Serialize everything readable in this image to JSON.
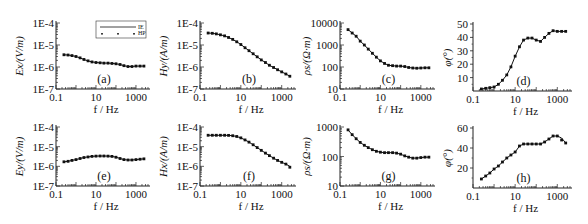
{
  "chart_data": [
    {
      "id": "a",
      "type": "line",
      "panel_label": "(a)",
      "ylabel": "Ex/(V/m)",
      "xlabel": "f / Hz",
      "yscale": "log",
      "ylim": [
        1e-07,
        0.0001
      ],
      "yticks": [
        "1E-7",
        "1E-6",
        "1E-5",
        "1E-4"
      ],
      "xscale": "log",
      "xlim": [
        0.1,
        4000
      ],
      "xticks": [
        "0.1",
        "10",
        "1000"
      ],
      "legend": {
        "position": "top-right",
        "entries": [
          "IE",
          "HP"
        ]
      },
      "x": [
        0.25,
        0.4,
        0.63,
        1,
        1.6,
        2.5,
        4,
        6.3,
        10,
        16,
        25,
        40,
        63,
        100,
        160,
        250,
        400,
        630,
        1000,
        1600,
        2500
      ],
      "series": [
        {
          "name": "IE",
          "style": "line",
          "values": [
            3.6e-06,
            3.5e-06,
            3.3e-06,
            3e-06,
            2.6e-06,
            2.2e-06,
            1.9e-06,
            1.7e-06,
            1.6e-06,
            1.55e-06,
            1.5e-06,
            1.5e-06,
            1.45e-06,
            1.4e-06,
            1.3e-06,
            1.15e-06,
            1.05e-06,
            1.05e-06,
            1.1e-06,
            1.1e-06,
            1.1e-06
          ]
        },
        {
          "name": "HP",
          "style": "points",
          "values": [
            3.6e-06,
            3.5e-06,
            3.3e-06,
            3e-06,
            2.6e-06,
            2.2e-06,
            1.9e-06,
            1.7e-06,
            1.6e-06,
            1.55e-06,
            1.5e-06,
            1.5e-06,
            1.45e-06,
            1.4e-06,
            1.3e-06,
            1.15e-06,
            1.05e-06,
            1.05e-06,
            1.1e-06,
            1.1e-06,
            1.1e-06
          ]
        }
      ]
    },
    {
      "id": "b",
      "type": "line",
      "panel_label": "(b)",
      "ylabel": "Hy/(A/m)",
      "xlabel": "f / Hz",
      "yscale": "log",
      "ylim": [
        1e-07,
        0.0001
      ],
      "yticks": [
        "1E-7",
        "1E-6",
        "1E-5",
        "1E-4"
      ],
      "xscale": "log",
      "xlim": [
        0.1,
        4000
      ],
      "xticks": [
        "0.1",
        "10",
        "1000"
      ],
      "x": [
        0.25,
        0.4,
        0.63,
        1,
        1.6,
        2.5,
        4,
        6.3,
        10,
        16,
        25,
        40,
        63,
        100,
        160,
        250,
        400,
        630,
        1000,
        1600,
        2500
      ],
      "series": [
        {
          "name": "IE",
          "style": "line",
          "values": [
            3.5e-05,
            3.4e-05,
            3.2e-05,
            2.9e-05,
            2.6e-05,
            2.2e-05,
            1.8e-05,
            1.4e-05,
            1.05e-05,
            7.5e-06,
            5.5e-06,
            4e-06,
            2.9e-06,
            2.1e-06,
            1.6e-06,
            1.2e-06,
            9.5e-07,
            7.5e-07,
            6e-07,
            4.8e-07,
            3.8e-07
          ]
        },
        {
          "name": "HP",
          "style": "points",
          "values": [
            3.5e-05,
            3.4e-05,
            3.2e-05,
            2.9e-05,
            2.6e-05,
            2.2e-05,
            1.8e-05,
            1.4e-05,
            1.05e-05,
            7.5e-06,
            5.5e-06,
            4e-06,
            2.9e-06,
            2.1e-06,
            1.6e-06,
            1.2e-06,
            9.5e-07,
            7.5e-07,
            6e-07,
            4.8e-07,
            3.8e-07
          ]
        }
      ]
    },
    {
      "id": "c",
      "type": "line",
      "panel_label": "(c)",
      "ylabel": "ρs/(Ω·m)",
      "xlabel": "f / Hz",
      "yscale": "log",
      "ylim": [
        10,
        10000
      ],
      "yticks": [
        "10",
        "100",
        "1000",
        "10000"
      ],
      "xscale": "log",
      "xlim": [
        0.1,
        4000
      ],
      "xticks": [
        "0.1",
        "10",
        "1000"
      ],
      "x": [
        0.25,
        0.4,
        0.63,
        1,
        1.6,
        2.5,
        4,
        6.3,
        10,
        16,
        25,
        40,
        63,
        100,
        160,
        250,
        400,
        630,
        1000,
        1600,
        2500
      ],
      "series": [
        {
          "name": "IE",
          "style": "line",
          "values": [
            5000,
            3500,
            2500,
            1500,
            1000,
            650,
            420,
            280,
            190,
            145,
            120,
            115,
            110,
            110,
            105,
            95,
            90,
            88,
            90,
            92,
            92
          ]
        },
        {
          "name": "HP",
          "style": "points",
          "values": [
            5000,
            3500,
            2500,
            1500,
            1000,
            650,
            420,
            280,
            190,
            145,
            120,
            115,
            110,
            110,
            105,
            95,
            90,
            88,
            90,
            92,
            92
          ]
        }
      ]
    },
    {
      "id": "d",
      "type": "line",
      "panel_label": "(d)",
      "ylabel": "φ(°)",
      "xlabel": "f / Hz",
      "yscale": "linear",
      "ylim": [
        0,
        50
      ],
      "yticks": [
        "10",
        "20",
        "30",
        "40",
        "50"
      ],
      "xscale": "log",
      "xlim": [
        0.1,
        4000
      ],
      "xticks": [
        "0.1",
        "10",
        "1000"
      ],
      "x": [
        0.25,
        0.4,
        0.63,
        1,
        1.6,
        2.5,
        4,
        6.3,
        10,
        16,
        25,
        40,
        63,
        100,
        160,
        250,
        400,
        630,
        1000,
        1600,
        2500
      ],
      "series": [
        {
          "name": "IE",
          "style": "line",
          "values": [
            1.5,
            2,
            2.5,
            3,
            5,
            8,
            12,
            18,
            26,
            33,
            38,
            39.5,
            39.5,
            38,
            37,
            40,
            43,
            45,
            44.5,
            44.5,
            44.5
          ]
        },
        {
          "name": "HP",
          "style": "points",
          "values": [
            1.5,
            2,
            2.5,
            3,
            5,
            8,
            12,
            18,
            26,
            33,
            38,
            39.5,
            39.5,
            38,
            37,
            40,
            43,
            45,
            44.5,
            44.5,
            44.5
          ]
        }
      ]
    },
    {
      "id": "e",
      "type": "line",
      "panel_label": "(e)",
      "ylabel": "Ey/(V/m)",
      "xlabel": "f / Hz",
      "yscale": "log",
      "ylim": [
        1e-07,
        0.0001
      ],
      "yticks": [
        "1E-7",
        "1E-6",
        "1E-5",
        "1E-4"
      ],
      "xscale": "log",
      "xlim": [
        0.1,
        4000
      ],
      "xticks": [
        "0.1",
        "10",
        "1000"
      ],
      "x": [
        0.25,
        0.4,
        0.63,
        1,
        1.6,
        2.5,
        4,
        6.3,
        10,
        16,
        25,
        40,
        63,
        100,
        160,
        250,
        400,
        630,
        1000,
        1600,
        2500
      ],
      "series": [
        {
          "name": "IE",
          "style": "line",
          "values": [
            1.7e-06,
            1.8e-06,
            2e-06,
            2.2e-06,
            2.5e-06,
            2.8e-06,
            3e-06,
            3.2e-06,
            3.3e-06,
            3.35e-06,
            3.35e-06,
            3.3e-06,
            3.2e-06,
            2.9e-06,
            2.5e-06,
            2.2e-06,
            2.1e-06,
            2.1e-06,
            2.2e-06,
            2.3e-06,
            2.4e-06
          ]
        },
        {
          "name": "HP",
          "style": "points",
          "values": [
            1.7e-06,
            1.8e-06,
            2e-06,
            2.2e-06,
            2.5e-06,
            2.8e-06,
            3e-06,
            3.2e-06,
            3.3e-06,
            3.35e-06,
            3.35e-06,
            3.3e-06,
            3.2e-06,
            2.9e-06,
            2.5e-06,
            2.2e-06,
            2.1e-06,
            2.1e-06,
            2.2e-06,
            2.3e-06,
            2.4e-06
          ]
        }
      ]
    },
    {
      "id": "f",
      "type": "line",
      "panel_label": "(f)",
      "ylabel": "Hx/(A/m)",
      "xlabel": "f / Hz",
      "yscale": "log",
      "ylim": [
        1e-07,
        0.0001
      ],
      "yticks": [
        "1E-7",
        "1E-6",
        "1E-5",
        "1E-4"
      ],
      "xscale": "log",
      "xlim": [
        0.1,
        4000
      ],
      "xticks": [
        "0.1",
        "10",
        "1000"
      ],
      "x": [
        0.25,
        0.4,
        0.63,
        1,
        1.6,
        2.5,
        4,
        6.3,
        10,
        16,
        25,
        40,
        63,
        100,
        160,
        250,
        400,
        630,
        1000,
        1600,
        2500
      ],
      "series": [
        {
          "name": "IE",
          "style": "line",
          "values": [
            3.8e-05,
            3.8e-05,
            3.8e-05,
            3.8e-05,
            3.8e-05,
            3.75e-05,
            3.6e-05,
            3.3e-05,
            2.8e-05,
            2.2e-05,
            1.7e-05,
            1.25e-05,
            9e-06,
            6.5e-06,
            4.7e-06,
            3.5e-06,
            2.6e-06,
            2e-06,
            1.6e-06,
            1.3e-06,
            1e-06
          ]
        },
        {
          "name": "HP",
          "style": "points",
          "values": [
            3.8e-05,
            3.8e-05,
            3.8e-05,
            3.8e-05,
            3.8e-05,
            3.75e-05,
            3.6e-05,
            3.3e-05,
            2.8e-05,
            2.2e-05,
            1.7e-05,
            1.25e-05,
            9e-06,
            6.5e-06,
            4.7e-06,
            3.5e-06,
            2.6e-06,
            2e-06,
            1.6e-06,
            1.3e-06,
            9e-07
          ]
        }
      ]
    },
    {
      "id": "g",
      "type": "line",
      "panel_label": "(g)",
      "ylabel": "ρs/(Ω·m)",
      "xlabel": "f / Hz",
      "yscale": "log",
      "ylim": [
        10,
        1000
      ],
      "yticks": [
        "10",
        "100",
        "1000"
      ],
      "xscale": "log",
      "xlim": [
        0.1,
        4000
      ],
      "xticks": [
        "0.1",
        "10",
        "1000"
      ],
      "x": [
        0.25,
        0.4,
        0.63,
        1,
        1.6,
        2.5,
        4,
        6.3,
        10,
        16,
        25,
        40,
        63,
        100,
        160,
        250,
        400,
        630,
        1000,
        1600,
        2500
      ],
      "series": [
        {
          "name": "IE",
          "style": "line",
          "values": [
            800,
            550,
            400,
            300,
            240,
            200,
            170,
            150,
            140,
            135,
            135,
            135,
            130,
            120,
            105,
            95,
            88,
            88,
            92,
            95,
            95
          ]
        },
        {
          "name": "HP",
          "style": "points",
          "values": [
            800,
            550,
            400,
            300,
            240,
            200,
            170,
            150,
            140,
            135,
            135,
            135,
            130,
            120,
            105,
            95,
            88,
            88,
            92,
            95,
            95
          ]
        }
      ]
    },
    {
      "id": "h",
      "type": "line",
      "panel_label": "(h)",
      "ylabel": "φ(°)",
      "xlabel": "f / Hz",
      "yscale": "linear",
      "ylim": [
        0,
        60
      ],
      "yticks": [
        "20",
        "40",
        "60"
      ],
      "xscale": "log",
      "xlim": [
        0.1,
        4000
      ],
      "xticks": [
        "0.1",
        "10",
        "1000"
      ],
      "x": [
        0.25,
        0.4,
        0.63,
        1,
        1.6,
        2.5,
        4,
        6.3,
        10,
        16,
        25,
        40,
        63,
        100,
        160,
        250,
        400,
        630,
        1000,
        1600,
        2500
      ],
      "series": [
        {
          "name": "IE",
          "style": "line",
          "values": [
            9,
            12,
            15,
            19,
            22,
            26,
            30,
            33,
            36,
            42,
            44,
            44,
            44,
            44,
            44,
            46,
            49,
            52,
            52,
            50,
            45
          ]
        },
        {
          "name": "HP",
          "style": "points",
          "values": [
            9,
            12,
            15,
            19,
            22,
            26,
            30,
            33,
            36,
            42,
            44,
            44,
            44,
            44,
            44,
            46,
            49,
            52,
            52,
            48,
            45
          ]
        }
      ]
    }
  ]
}
